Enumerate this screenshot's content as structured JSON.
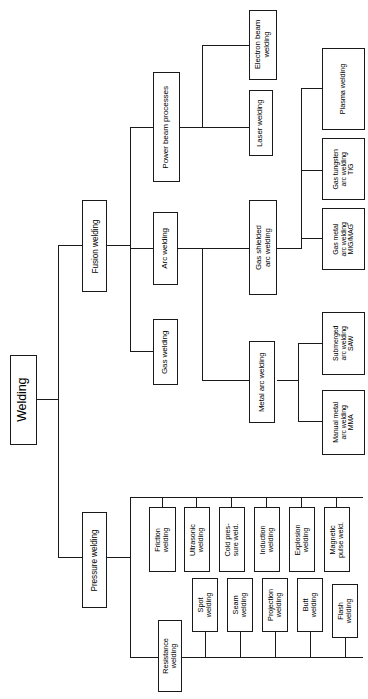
{
  "diagram": {
    "title": "Welding",
    "type": "tree",
    "orientation": "rotated-90-ccw",
    "root": {
      "id": "welding",
      "label": "Welding",
      "children": [
        {
          "id": "fusion-welding",
          "label": "Fusion welding",
          "children": [
            {
              "id": "power-beam-processes",
              "label": "Power beam processes",
              "children": [
                {
                  "id": "electron-beam-welding",
                  "label": "Electron beam\nwelding"
                },
                {
                  "id": "laser-welding",
                  "label": "Laser welding"
                }
              ]
            },
            {
              "id": "arc-welding",
              "label": "Arc welding",
              "children": [
                {
                  "id": "gas-shielded-arc-welding",
                  "label": "Gas shielded\narc welding",
                  "children": [
                    {
                      "id": "plasma-welding",
                      "label": "Plasma welding"
                    },
                    {
                      "id": "gas-tungsten-arc-welding-tig",
                      "label": "Gas tungsten\narc welding\nTIG"
                    },
                    {
                      "id": "gas-metal-arc-welding-mig-mag",
                      "label": "Gas metal\narc welding\nMIG/MAG"
                    }
                  ]
                },
                {
                  "id": "metal-arc-welding",
                  "label": "Metal arc welding",
                  "children": [
                    {
                      "id": "submerged-arc-welding-saw",
                      "label": "Submerged\narc welding\nSAW"
                    },
                    {
                      "id": "manual-metal-arc-welding-mma",
                      "label": "Manual metal\narc welding\nMMA"
                    }
                  ]
                }
              ]
            },
            {
              "id": "gas-welding",
              "label": "Gas welding"
            }
          ]
        },
        {
          "id": "pressure-welding",
          "label": "Pressure welding",
          "children": [
            {
              "id": "friction-welding",
              "label": "Friction\nwelding"
            },
            {
              "id": "ultrasonic-welding",
              "label": "Ultrasonic\nwelding"
            },
            {
              "id": "cold-pressure-weld",
              "label": "Cold pres-\nsure weld."
            },
            {
              "id": "induction-welding",
              "label": "Induction\nwelding"
            },
            {
              "id": "explosion-welding",
              "label": "Explosion\nwelding"
            },
            {
              "id": "magnetic-pulse-weld",
              "label": "Magnetic\npulse weld."
            },
            {
              "id": "resistance-welding",
              "label": "Resistance\nwelding",
              "children": [
                {
                  "id": "spot-welding",
                  "label": "Spot\nwelding"
                },
                {
                  "id": "seam-welding",
                  "label": "Seam\nwelding"
                },
                {
                  "id": "projection-welding",
                  "label": "Projection\nwelding"
                },
                {
                  "id": "butt-welding",
                  "label": "Butt\nwelding"
                },
                {
                  "id": "flash-welding",
                  "label": "Flash\nwelding"
                }
              ]
            }
          ]
        }
      ]
    }
  },
  "labels": {
    "welding": "Welding",
    "fusion_welding": "Fusion welding",
    "pressure_welding": "Pressure welding",
    "power_beam_processes": "Power beam processes",
    "arc_welding": "Arc welding",
    "gas_welding": "Gas welding",
    "electron_beam_welding": "Electron beam\nwelding",
    "laser_welding": "Laser welding",
    "gas_shielded_arc_welding": "Gas shielded\narc welding",
    "metal_arc_welding": "Metal arc welding",
    "plasma_welding": "Plasma welding",
    "gas_tungsten_arc_welding_tig": "Gas tungsten\narc welding\nTIG",
    "gas_metal_arc_welding_mig_mag": "Gas metal\narc welding\nMIG/MAG",
    "submerged_arc_welding_saw": "Submerged\narc welding\nSAW",
    "manual_metal_arc_welding_mma": "Manual metal\narc welding\nMMA",
    "friction_welding": "Friction\nwelding",
    "ultrasonic_welding": "Ultrasonic\nwelding",
    "cold_pressure_weld": "Cold pres-\nsure weld.",
    "induction_welding": "Induction\nwelding",
    "explosion_welding": "Explosion\nwelding",
    "magnetic_pulse_weld": "Magnetic\npulse weld.",
    "resistance_welding": "Resistance\nwelding",
    "spot_welding": "Spot\nwelding",
    "seam_welding": "Seam\nwelding",
    "projection_welding": "Projection\nwelding",
    "butt_welding": "Butt\nwelding",
    "flash_welding": "Flash\nwelding"
  },
  "colors": {
    "background": "#ffffff",
    "stroke": "#1a1a1a",
    "text": "#000000"
  }
}
